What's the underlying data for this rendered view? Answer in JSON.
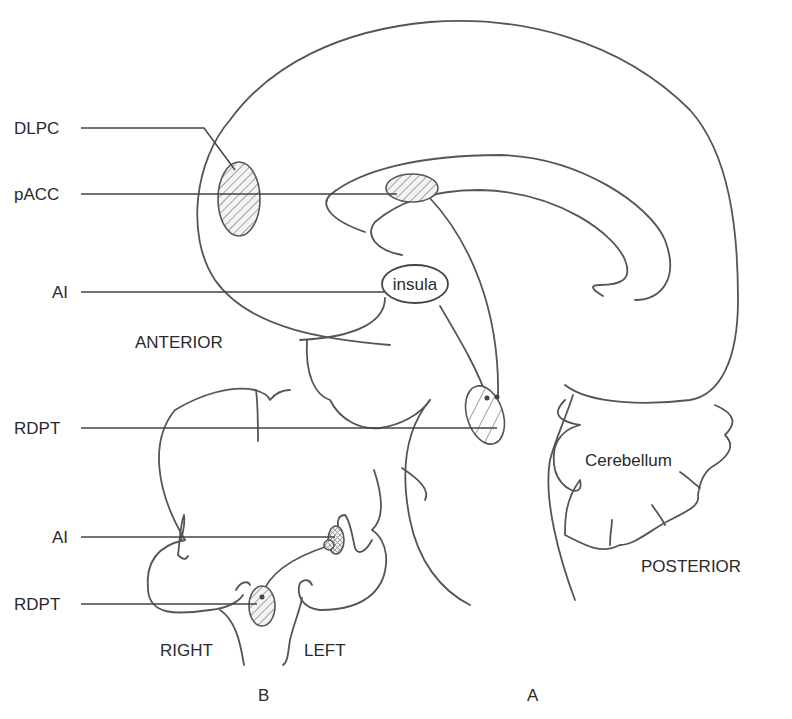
{
  "figure": {
    "panels": [
      {
        "id": "A",
        "label": "A",
        "view": "sagittal"
      },
      {
        "id": "B",
        "label": "B",
        "view": "coronal"
      }
    ],
    "region_labels": {
      "dlpc": "DLPC",
      "pacc": "pACC",
      "ai_a": "AI",
      "rdpt_a": "RDPT",
      "ai_b": "AI",
      "rdpt_b": "RDPT"
    },
    "anatomy_labels": {
      "insula": "insula",
      "cerebellum": "Cerebellum",
      "anterior": "ANTERIOR",
      "posterior": "POSTERIOR",
      "right": "RIGHT",
      "left": "LEFT"
    },
    "colors": {
      "line": "#555555",
      "text": "#2a2a2a",
      "hatch": "#777777",
      "region_fill": "#f4f4f4",
      "background": "#ffffff"
    }
  }
}
